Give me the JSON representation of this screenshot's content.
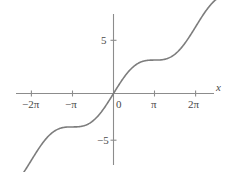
{
  "chart_data": {
    "type": "line",
    "title": "",
    "subtitle": "",
    "xlabel": "x",
    "ylabel": "",
    "function": "x + sin(x)",
    "xlim": [
      -7.85,
      7.85
    ],
    "ylim": [
      -8.3,
      8.3
    ],
    "grid": false,
    "legend": null,
    "axis_color": "#8c8c8c",
    "curve_color": "#7d7d7d",
    "text_color": "#4a4a4a",
    "xticks": [
      {
        "value": -6.2832,
        "label": "−2π",
        "coefficient": "−2",
        "symbol": "π"
      },
      {
        "value": -3.1416,
        "label": "−π",
        "coefficient": "−",
        "symbol": "π"
      },
      {
        "value": 0,
        "label": "0",
        "coefficient": "0",
        "symbol": ""
      },
      {
        "value": 3.1416,
        "label": "π",
        "coefficient": "",
        "symbol": "π"
      },
      {
        "value": 6.2832,
        "label": "2π",
        "coefficient": "2",
        "symbol": "π"
      }
    ],
    "yticks": [
      {
        "value": 5,
        "label": "5"
      },
      {
        "value": -5,
        "label": "−5"
      }
    ],
    "x": [
      -7.85,
      -7.5,
      -7.0,
      -6.5,
      -6.2832,
      -6.0,
      -5.5,
      -5.0,
      -4.5,
      -4.0,
      -3.5,
      -3.1416,
      -3.0,
      -2.5,
      -2.0,
      -1.5,
      -1.0,
      -0.5,
      0,
      0.5,
      1.0,
      1.5,
      2.0,
      2.5,
      3.0,
      3.1416,
      3.5,
      4.0,
      4.5,
      5.0,
      5.5,
      6.0,
      6.2832,
      6.5,
      7.0,
      7.5,
      7.85
    ],
    "y": [
      -6.85,
      -6.56,
      -6.34,
      -6.29,
      -6.2832,
      -6.28,
      -6.21,
      -5.96,
      -5.52,
      -4.76,
      -3.85,
      -3.1416,
      -2.86,
      -2.1,
      -1.09,
      0.5,
      -0.159,
      -0.979,
      0,
      0.979,
      1.841,
      2.497,
      2.909,
      3.099,
      3.141,
      3.1416,
      3.149,
      3.243,
      3.522,
      4.041,
      4.793,
      5.721,
      6.2832,
      6.715,
      7.657,
      8.437,
      8.85
    ]
  },
  "annotations": {
    "axis_label_x": "x",
    "origin_label": "0"
  }
}
